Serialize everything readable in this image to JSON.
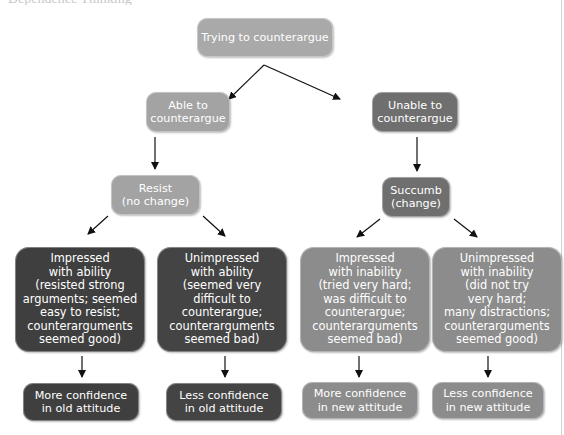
{
  "page": {
    "clipped_header_text": "Dependence Thinking"
  },
  "diagram": {
    "root": {
      "label": "Trying to counterargue",
      "shade": "#a9a9a9"
    },
    "branches": [
      {
        "label": "Able to\ncounterargue",
        "shade": "#a3a3a3",
        "outcome": {
          "label": "Resist\n(no change)",
          "shade": "#a3a3a3"
        },
        "reactions": [
          {
            "label": "Impressed\nwith ability\n(resisted strong\narguments; seemed\neasy to resist;\ncounterarguments\nseemed good)",
            "shade": "#3f3f3f",
            "result": "More confidence\nin old attitude"
          },
          {
            "label": "Unimpressed\nwith ability\n(seemed very\ndifficult to\ncounterargue;\ncounterarguments\nseemed bad)",
            "shade": "#444444",
            "result": "Less confidence\nin old attitude"
          }
        ]
      },
      {
        "label": "Unable to\ncounterargue",
        "shade": "#6f6f6f",
        "outcome": {
          "label": "Succumb\n(change)",
          "shade": "#6f6f6f"
        },
        "reactions": [
          {
            "label": "Impressed\nwith inability\n(tried very hard;\nwas difficult to\ncounterargue;\ncounterarguments\nseemed bad)",
            "shade": "#8c8c8c",
            "result": "More confidence\nin new attitude"
          },
          {
            "label": "Unimpressed\nwith inability\n(did not try\nvery hard;\nmany distractions;\ncounterarguments\nseemed good)",
            "shade": "#8c8c8c",
            "result": "Less confidence\nin new attitude"
          }
        ]
      }
    ]
  }
}
